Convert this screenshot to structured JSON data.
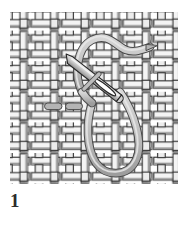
{
  "figure": {
    "number_label": "1",
    "caption": ""
  },
  "canvas": {
    "width": 186,
    "height": 226,
    "background": "#ffffff"
  },
  "fabric": {
    "name": "plain-weave-fabric",
    "x": 10,
    "y": 12,
    "width": 168,
    "height": 172,
    "cols": 11,
    "rows": 11,
    "cell": 15.3,
    "thread_fill": "#f2f2f2",
    "thread_fill_alt": "#e2e2e2",
    "thread_outline": "#2f2f2f",
    "gap_color": "#ffffff",
    "shadow": "#8d8d8d"
  },
  "thread": {
    "name": "embroidery-thread",
    "fill": "#bcbcbc",
    "outline": "#4a4a4a",
    "highlight": "#e6e6e6",
    "width": 7,
    "shape": "s-curve-with-lower-loop",
    "tail_end": "tapered-point-top-right"
  },
  "needle": {
    "name": "sewing-needle",
    "body_fill": "#cfcfcf",
    "body_outline": "#262626",
    "eye_fill": "#ffffff",
    "angle_deg": 38,
    "tip": "lower-left",
    "eye": "upper-right"
  },
  "stitch": {
    "name": "completed-stitch",
    "fill": "#b4b4b4",
    "outline": "#4a4a4a",
    "segments": 2,
    "position": "left-of-needle-tip"
  },
  "colors": {
    "ink": "#2b2b2b",
    "paper": "#ffffff"
  }
}
